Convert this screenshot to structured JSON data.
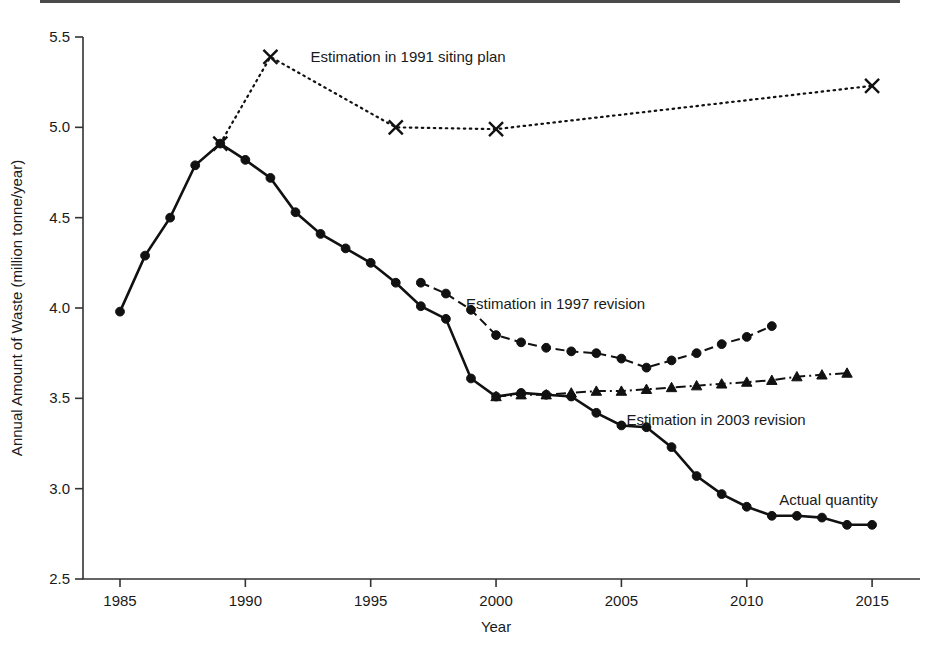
{
  "chart_data": {
    "type": "line",
    "title": "",
    "xlabel": "Year",
    "ylabel": "Annual Amount of Waste (million tonne/year)",
    "xlim": [
      1983.5,
      2016.5
    ],
    "ylim": [
      2.5,
      5.5
    ],
    "xticks": [
      1985,
      1990,
      1995,
      2000,
      2005,
      2010,
      2015
    ],
    "yticks": [
      2.5,
      3.0,
      3.5,
      4.0,
      4.5,
      5.0,
      5.5
    ],
    "xtick_labels": [
      "1985",
      "1990",
      "1995",
      "2000",
      "2005",
      "2010",
      "2015"
    ],
    "ytick_labels": [
      "2.5",
      "3.0",
      "3.5",
      "4.0",
      "4.5",
      "5.0",
      "5.5"
    ],
    "grid": false,
    "legend_position": "inline-annotations",
    "series": [
      {
        "name": "Actual quantity",
        "marker": "circle",
        "linestyle": "solid",
        "label_x": 2011.3,
        "label_y": 2.94,
        "x": [
          1985,
          1986,
          1987,
          1988,
          1989,
          1990,
          1991,
          1992,
          1993,
          1994,
          1995,
          1996,
          1997,
          1998,
          1999,
          2000,
          2001,
          2002,
          2003,
          2004,
          2005,
          2006,
          2007,
          2008,
          2009,
          2010,
          2011,
          2012,
          2013,
          2014,
          2015
        ],
        "values": [
          3.98,
          4.29,
          4.5,
          4.79,
          4.91,
          4.82,
          4.72,
          4.53,
          4.41,
          4.33,
          4.25,
          4.14,
          4.01,
          3.94,
          3.61,
          3.51,
          3.53,
          3.52,
          3.51,
          3.42,
          3.35,
          3.34,
          3.23,
          3.07,
          2.97,
          2.9,
          2.85,
          2.85,
          2.84,
          2.8,
          2.8
        ]
      },
      {
        "name": "Estimation in 1991 siting plan",
        "marker": "cross",
        "linestyle": "dotted",
        "label_x": 1992.6,
        "label_y": 5.39,
        "x": [
          1989,
          1991,
          1996,
          2000,
          2015
        ],
        "values": [
          4.91,
          5.39,
          5.0,
          4.99,
          5.23
        ]
      },
      {
        "name": "Estimation in 1997 revision",
        "marker": "circle",
        "linestyle": "dashed",
        "label_x": 1998.8,
        "label_y": 4.02,
        "x": [
          1997,
          1998,
          1999,
          2000,
          2001,
          2002,
          2003,
          2004,
          2005,
          2006,
          2007,
          2008,
          2009,
          2010,
          2011
        ],
        "values": [
          4.14,
          4.08,
          3.99,
          3.85,
          3.81,
          3.78,
          3.76,
          3.75,
          3.72,
          3.67,
          3.71,
          3.75,
          3.8,
          3.84,
          3.9
        ]
      },
      {
        "name": "Estimation in 2003 revision",
        "marker": "triangle",
        "linestyle": "dash-dot",
        "label_x": 2005.2,
        "label_y": 3.38,
        "x": [
          2000,
          2001,
          2002,
          2003,
          2004,
          2005,
          2006,
          2007,
          2008,
          2009,
          2010,
          2011,
          2012,
          2013,
          2014
        ],
        "values": [
          3.51,
          3.52,
          3.52,
          3.53,
          3.54,
          3.54,
          3.55,
          3.56,
          3.57,
          3.58,
          3.59,
          3.6,
          3.62,
          3.63,
          3.64
        ]
      }
    ]
  }
}
